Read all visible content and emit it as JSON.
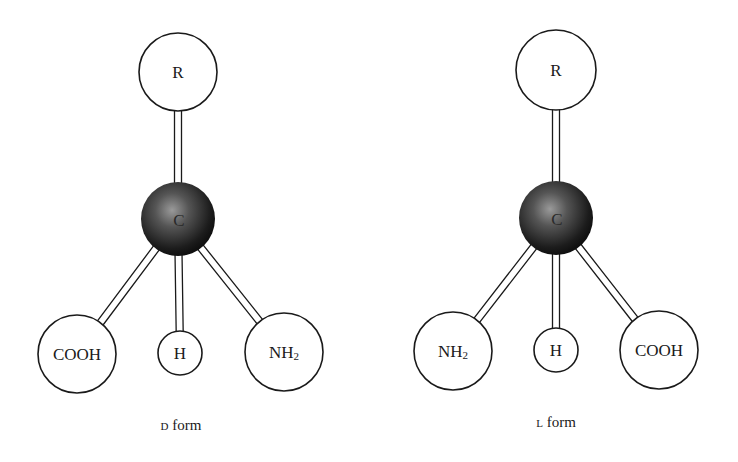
{
  "figure": {
    "colors": {
      "line": "#1a1a1a",
      "background": "#ffffff",
      "carbon_dark": "#111111",
      "carbon_light": "#8a8a8a"
    },
    "molecules": [
      {
        "id": "d",
        "caption": {
          "prefix": "D",
          "text": " form"
        },
        "center": {
          "label": "C",
          "x": 178,
          "y": 219,
          "r": 37
        },
        "groups": [
          {
            "name": "r",
            "label": "R",
            "sub": "",
            "x": 178,
            "y": 72,
            "r": 39
          },
          {
            "name": "cooh",
            "label": "COOH",
            "sub": "",
            "x": 77,
            "y": 354,
            "r": 39
          },
          {
            "name": "h",
            "label": "H",
            "sub": "",
            "x": 180,
            "y": 353,
            "r": 22
          },
          {
            "name": "nh2",
            "label": "NH",
            "sub": "2",
            "x": 284,
            "y": 352,
            "r": 39
          }
        ],
        "caption_pos": {
          "x": 181,
          "y": 430
        }
      },
      {
        "id": "l",
        "caption": {
          "prefix": "L",
          "text": " form"
        },
        "center": {
          "label": "C",
          "x": 556,
          "y": 218,
          "r": 37
        },
        "groups": [
          {
            "name": "r",
            "label": "R",
            "sub": "",
            "x": 556,
            "y": 70,
            "r": 40
          },
          {
            "name": "nh2",
            "label": "NH",
            "sub": "2",
            "x": 453,
            "y": 351,
            "r": 39
          },
          {
            "name": "h",
            "label": "H",
            "sub": "",
            "x": 556,
            "y": 350,
            "r": 22
          },
          {
            "name": "cooh",
            "label": "COOH",
            "sub": "",
            "x": 659,
            "y": 350,
            "r": 39
          }
        ],
        "caption_pos": {
          "x": 556,
          "y": 427
        }
      }
    ]
  }
}
